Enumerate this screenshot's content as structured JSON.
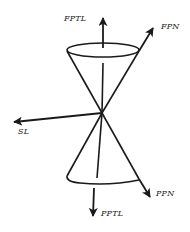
{
  "diagram": {
    "type": "double-cone vector diagram",
    "labels": {
      "fptl": "FPTL",
      "fpn": "FPN",
      "sl": "SL",
      "ppn": "PPN",
      "pptl": "PPTL"
    },
    "colors": {
      "stroke": "#1a1a1a",
      "background": "#ffffff"
    },
    "vectors": [
      {
        "id": "FPTL",
        "direction": "up"
      },
      {
        "id": "FPN",
        "direction": "up-right"
      },
      {
        "id": "SL",
        "direction": "left"
      },
      {
        "id": "PPN",
        "direction": "down-right"
      },
      {
        "id": "PPTL",
        "direction": "down"
      }
    ],
    "cones": [
      {
        "id": "upper-cone",
        "opens": "up"
      },
      {
        "id": "lower-cone",
        "opens": "down"
      }
    ]
  }
}
